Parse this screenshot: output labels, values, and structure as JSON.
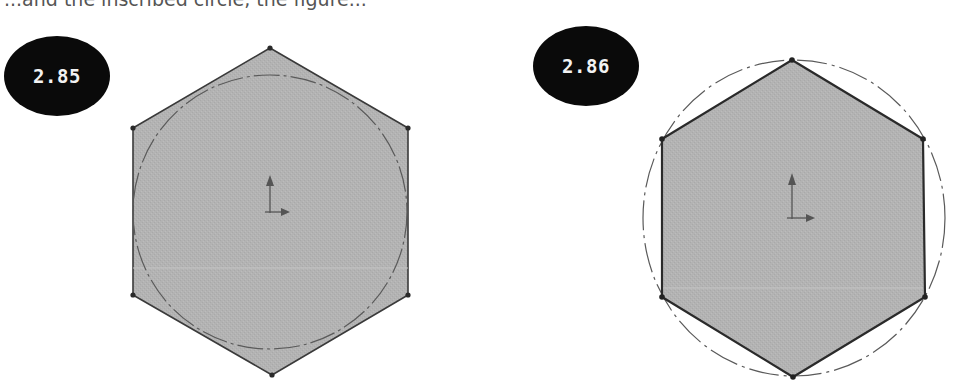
{
  "top_caption_fragment": "...and the inscribed circle, the figure...",
  "figures": [
    {
      "label": "2.85",
      "description": "Hexagon circumscribed around a circle (circle inscribed in hexagon)",
      "hexagon_fill": "#b5b5b5",
      "hexagon_stroke": "#3a3a3a",
      "circle_stroke": "#555555",
      "circle_style": "dash-dot construction line",
      "origin_marker": "coordinate-axes-icon"
    },
    {
      "label": "2.86",
      "description": "Hexagon inscribed in a circle (circle circumscribed about hexagon)",
      "hexagon_fill": "#b5b5b5",
      "hexagon_stroke": "#2a2a2a",
      "circle_stroke": "#555555",
      "circle_style": "dash-dot construction line",
      "origin_marker": "coordinate-axes-icon"
    }
  ]
}
